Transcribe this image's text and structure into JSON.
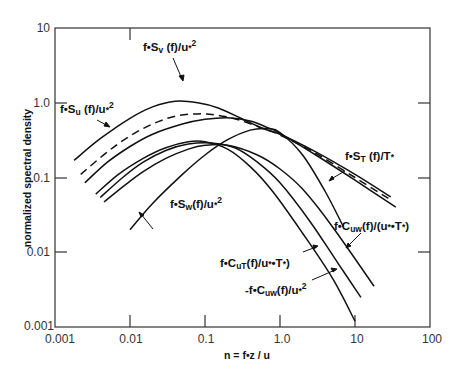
{
  "chart_data": {
    "type": "line",
    "title": "",
    "xlabel": "n = f•z / u",
    "ylabel": "normalized spectral density",
    "xscale": "log",
    "yscale": "log",
    "xlim": [
      0.001,
      100
    ],
    "ylim": [
      0.001,
      10
    ],
    "grid": false,
    "legend": "inline annotations with arrows",
    "x_ticks": [
      "0.001",
      "0.01",
      "0.1",
      "1.0",
      "10",
      "100"
    ],
    "y_ticks": [
      "0.001",
      "0.01",
      "0.1",
      "1.0",
      "10"
    ],
    "series": [
      {
        "name": "f•Su(f)/u*²",
        "style": "solid",
        "x": [
          0.0018,
          0.004,
          0.01,
          0.02,
          0.04,
          0.08,
          0.15,
          0.3,
          0.6,
          1.0,
          3,
          10,
          30
        ],
        "y": [
          0.17,
          0.33,
          0.62,
          0.88,
          1.05,
          1.0,
          0.85,
          0.62,
          0.45,
          0.38,
          0.22,
          0.11,
          0.055
        ]
      },
      {
        "name": "f•ST(f)/T*",
        "style": "dashed",
        "x": [
          0.0022,
          0.005,
          0.01,
          0.02,
          0.04,
          0.08,
          0.15,
          0.3,
          0.6,
          1.0,
          3,
          10,
          30
        ],
        "y": [
          0.11,
          0.22,
          0.36,
          0.52,
          0.66,
          0.71,
          0.68,
          0.58,
          0.45,
          0.37,
          0.21,
          0.1,
          0.05
        ]
      },
      {
        "name": "f•Sv(f)/u*²",
        "style": "solid",
        "x": [
          0.0025,
          0.005,
          0.01,
          0.02,
          0.05,
          0.1,
          0.2,
          0.4,
          0.7,
          1.0,
          3,
          10,
          35
        ],
        "y": [
          0.085,
          0.16,
          0.26,
          0.38,
          0.52,
          0.6,
          0.63,
          0.57,
          0.46,
          0.39,
          0.2,
          0.092,
          0.04
        ]
      },
      {
        "name": "f•CuT(f)/(u*•T*)",
        "style": "solid",
        "x": [
          0.0035,
          0.007,
          0.015,
          0.03,
          0.06,
          0.1,
          0.2,
          0.4,
          0.8,
          2,
          5,
          10
        ],
        "y": [
          0.06,
          0.11,
          0.18,
          0.25,
          0.3,
          0.3,
          0.24,
          0.14,
          0.065,
          0.018,
          0.0045,
          0.0012
        ]
      },
      {
        "name": "-f•Cuw(f)/u*²",
        "style": "solid",
        "x": [
          0.004,
          0.008,
          0.015,
          0.03,
          0.06,
          0.12,
          0.25,
          0.5,
          1.0,
          2.5,
          6,
          12
        ],
        "y": [
          0.054,
          0.1,
          0.16,
          0.23,
          0.28,
          0.29,
          0.25,
          0.16,
          0.085,
          0.026,
          0.007,
          0.0025
        ]
      },
      {
        "name": "f•Cuw(f)/(u*•T*)",
        "style": "solid",
        "x": [
          0.0045,
          0.008,
          0.015,
          0.03,
          0.06,
          0.1,
          0.2,
          0.5,
          1.0,
          2,
          5,
          18
        ],
        "y": [
          0.047,
          0.075,
          0.12,
          0.18,
          0.24,
          0.27,
          0.27,
          0.2,
          0.13,
          0.07,
          0.022,
          0.0035
        ]
      },
      {
        "name": "f•Sw(f)/u*²",
        "style": "solid",
        "x": [
          0.01,
          0.02,
          0.05,
          0.1,
          0.2,
          0.4,
          0.7,
          1.0,
          2.0,
          4.0,
          7.0
        ],
        "y": [
          0.02,
          0.045,
          0.11,
          0.2,
          0.32,
          0.43,
          0.45,
          0.4,
          0.2,
          0.065,
          0.022
        ]
      }
    ],
    "annotations": [
      {
        "text": "f•Su(f)/u*²",
        "label_x": 0.0013,
        "label_y": 1.15
      },
      {
        "text": "f•Sv(f)/u*²",
        "label_x": 0.015,
        "label_y": 1.7
      },
      {
        "text": "f•ST(f)/T*",
        "label_x": 2.0,
        "label_y": 0.24
      },
      {
        "text": "f•Sw(f)/u*²",
        "label_x": 0.08,
        "label_y": 0.045
      },
      {
        "text": "f•Cuw(f)/(u*•T*)",
        "label_x": 4.5,
        "label_y": 0.03
      },
      {
        "text": "f•CuT(f)/(u*•T*)",
        "label_x": 0.16,
        "label_y": 0.0095
      },
      {
        "text": "-f•Cuw(f)/u*²",
        "label_x": 0.3,
        "label_y": 0.004
      }
    ]
  },
  "labels": {
    "xlabel": "n = f•z / u",
    "ylabel": "normalized spectral density",
    "x_ticks": [
      "0.001",
      "0.01",
      "0.1",
      "1.0",
      "10",
      "100"
    ],
    "y_ticks": [
      "10",
      "1.0",
      "0.1",
      "0.01",
      "0.001"
    ],
    "ann_su": [
      "f•S",
      "u",
      " (f)/u",
      "*",
      "2"
    ],
    "ann_sv": [
      "f•S",
      "v",
      " (f)/u",
      "*",
      "2"
    ],
    "ann_st": [
      "f•S",
      "T",
      " (f)/T",
      "*"
    ],
    "ann_sw": [
      "f•S",
      "w",
      "(f)/u",
      "*",
      "2"
    ],
    "ann_cuw_t": [
      "f•C",
      "uw",
      "(f)/(u",
      "*",
      "•T",
      "*",
      ")"
    ],
    "ann_cut": [
      "f•C",
      "uT",
      "(f)/u",
      "*",
      "•T",
      "*",
      ")"
    ],
    "ann_cuw": [
      "-f•C",
      "uw",
      "(f)/u",
      "*",
      "2"
    ]
  }
}
